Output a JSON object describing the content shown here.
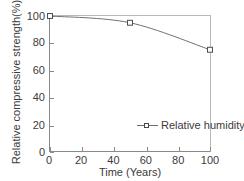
{
  "chart_data": {
    "type": "line",
    "title": "",
    "xlabel": "Time (Years)",
    "ylabel": "Relative compressive strength(%)",
    "xlim": [
      0,
      100
    ],
    "ylim": [
      0,
      100
    ],
    "xticks": [
      0,
      20,
      40,
      60,
      80,
      100
    ],
    "yticks": [
      0,
      20,
      40,
      60,
      80,
      100
    ],
    "grid": false,
    "legend_position": "inside-lower-right",
    "series": [
      {
        "name": "Relative humidity",
        "marker": "square",
        "color": "#6f6f6f",
        "x": [
          0,
          50,
          100
        ],
        "y": [
          100,
          95,
          75
        ]
      }
    ]
  },
  "axes": {
    "x_tick_labels": [
      "0",
      "20",
      "40",
      "60",
      "80",
      "100"
    ],
    "y_tick_labels": [
      "0",
      "20",
      "40",
      "60",
      "80",
      "100"
    ],
    "x_title": "Time (Years)",
    "y_title": "Relative compressive strength(%)"
  },
  "legend": {
    "entries": [
      {
        "label": "Relative humidity",
        "marker": "square-marker-icon"
      }
    ]
  },
  "colors": {
    "line": "#6f6f6f",
    "marker_edge": "#4a4a4a",
    "marker_fill": "#ffffff",
    "axis": "#8a8a8a",
    "text": "#3b3b3b",
    "background": "#ffffff"
  }
}
